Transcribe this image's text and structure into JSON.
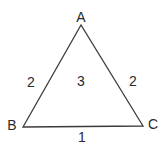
{
  "diagram": {
    "type": "triangle",
    "stroke_color": "#3a3a3a",
    "text_color": "#2a2a2a",
    "vertices": [
      {
        "id": "A",
        "label": "A",
        "x": 81,
        "y": 25,
        "label_x": 81,
        "label_y": 17
      },
      {
        "id": "B",
        "label": "B",
        "x": 23,
        "y": 127,
        "label_x": 12,
        "label_y": 125
      },
      {
        "id": "C",
        "label": "C",
        "x": 143,
        "y": 126,
        "label_x": 153,
        "label_y": 124
      }
    ],
    "edges": [
      {
        "from": "A",
        "to": "B",
        "label": "2",
        "label_x": 31,
        "label_y": 82
      },
      {
        "from": "A",
        "to": "C",
        "label": "2",
        "label_x": 133,
        "label_y": 81
      },
      {
        "from": "B",
        "to": "C",
        "label": "1",
        "label_x": 82,
        "label_y": 137
      }
    ],
    "face": {
      "label": "3",
      "label_x": 81,
      "label_y": 81
    }
  }
}
